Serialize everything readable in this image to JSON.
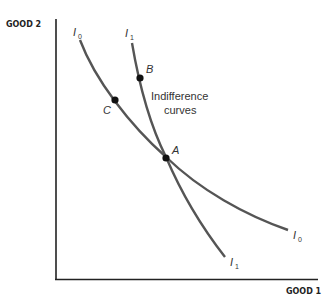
{
  "diagram": {
    "type": "indifference-curves",
    "axes": {
      "y_label": "GOOD 2",
      "x_label": "GOOD 1"
    },
    "curves": [
      {
        "id": "I0",
        "name": "I",
        "subscript": "0",
        "color": "#555555"
      },
      {
        "id": "I1",
        "name": "I",
        "subscript": "1",
        "color": "#555555"
      }
    ],
    "points": [
      {
        "id": "A",
        "label": "A"
      },
      {
        "id": "B",
        "label": "B"
      },
      {
        "id": "C",
        "label": "C"
      }
    ],
    "annotation": {
      "line1": "Indifference",
      "line2": "curves"
    }
  }
}
